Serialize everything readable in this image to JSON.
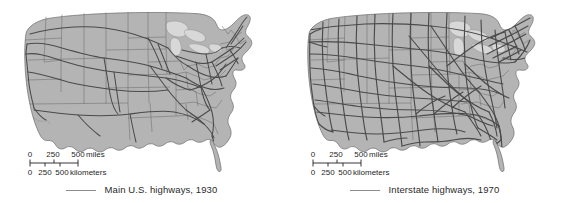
{
  "figure": {
    "background_color": "#ffffff",
    "land_color": "#b4b4b4",
    "land_border_color": "#6b6b6b",
    "state_border_color": "#6e6e6e",
    "lake_color": "#d8d8d8",
    "highway_color": "#4a4a4a",
    "text_color": "#2b2b2b"
  },
  "panels": [
    {
      "id": "panel-1930",
      "legend": {
        "label": "Main U.S. highways, 1930",
        "line_color": "#8d8d8d"
      },
      "scalebar": {
        "miles": {
          "unit_label": "miles",
          "ticks": [
            "0",
            "250",
            "500"
          ]
        },
        "kilometers": {
          "unit_label": "kilometers",
          "ticks": [
            "0",
            "250",
            "500"
          ]
        }
      }
    },
    {
      "id": "panel-1970",
      "legend": {
        "label": "Interstate highways, 1970",
        "line_color": "#8d8d8d"
      },
      "scalebar": {
        "miles": {
          "unit_label": "miles",
          "ticks": [
            "0",
            "250",
            "500"
          ]
        },
        "kilometers": {
          "unit_label": "kilometers",
          "ticks": [
            "0",
            "250",
            "500"
          ]
        }
      }
    }
  ]
}
